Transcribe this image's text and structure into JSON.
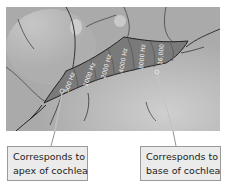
{
  "figure": {
    "bands": [
      {
        "label": "500 Hz"
      },
      {
        "label": "1000 Hz"
      },
      {
        "label": "2000 Hz"
      },
      {
        "label": "4000 Hz"
      },
      {
        "label": "8000 Hz"
      },
      {
        "label": "16,000"
      }
    ]
  },
  "callouts": {
    "left": {
      "line1": "Corresponds to",
      "line2": "apex of cochlea"
    },
    "right": {
      "line1": "Corresponds to",
      "line2": "base of cochlea"
    }
  },
  "colors": {
    "background": "#b9b9b9",
    "band_fill": "#7a7a7a",
    "band_dark": "#5e5e5e",
    "box_fill": "#ebebeb",
    "box_border": "#9a9a9a"
  }
}
